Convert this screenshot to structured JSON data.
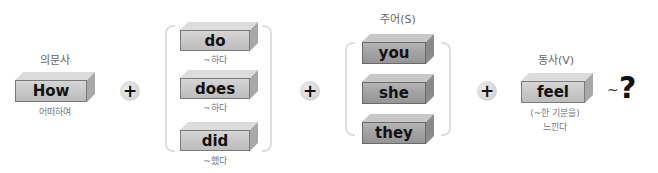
{
  "question_word": {
    "category_label": "의문사",
    "word": "How",
    "meaning": "어떠하여"
  },
  "operators": {
    "plus": "+",
    "tilde": "~",
    "question_mark": "?"
  },
  "auxiliary": {
    "options": [
      {
        "word": "do",
        "meaning": "~하다"
      },
      {
        "word": "does",
        "meaning": "~하다"
      },
      {
        "word": "did",
        "meaning": "~했다"
      }
    ]
  },
  "subject": {
    "category_label": "주어(S)",
    "options": [
      {
        "word": "you"
      },
      {
        "word": "she"
      },
      {
        "word": "they"
      }
    ]
  },
  "verb": {
    "category_label": "동사(V)",
    "word": "feel",
    "meaning_line1": "(~한 기분을)",
    "meaning_line2": "느낀다"
  },
  "colors": {
    "block_light": "#c9c9c9",
    "block_dark": "#a3a3a3",
    "bracket": "#dedede",
    "label_text": "#666666"
  }
}
